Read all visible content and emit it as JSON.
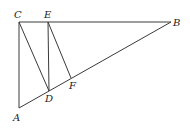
{
  "diagram": {
    "type": "geometry",
    "points": {
      "A": {
        "label": "A"
      },
      "B": {
        "label": "B"
      },
      "C": {
        "label": "C"
      },
      "D": {
        "label": "D"
      },
      "E": {
        "label": "E"
      },
      "F": {
        "label": "F"
      }
    },
    "segments": [
      [
        "C",
        "B"
      ],
      [
        "C",
        "A"
      ],
      [
        "A",
        "B"
      ],
      [
        "C",
        "D"
      ],
      [
        "E",
        "D"
      ],
      [
        "E",
        "F"
      ]
    ],
    "colors": {
      "line": "#3a3a3a",
      "label": "#222222"
    }
  }
}
